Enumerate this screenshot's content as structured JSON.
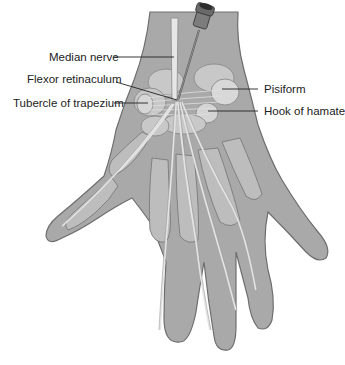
{
  "figure": {
    "colors": {
      "skin": "#a9a9a9",
      "skin_outline": "#6e6e6e",
      "bone": "#c4c4c4",
      "bone_highlight": "#d8d8d8",
      "tendon": "#e2e2e2",
      "needle": "#555555",
      "label_line": "#222222",
      "text": "#222222"
    },
    "labels": {
      "median_nerve": "Median nerve",
      "flexor_retinaculum": "Flexor retinaculum",
      "tubercle_of_trapezium": "Tubercle of trapezium",
      "pisiform": "Pisiform",
      "hook_of_hamate": "Hook of hamate"
    }
  }
}
